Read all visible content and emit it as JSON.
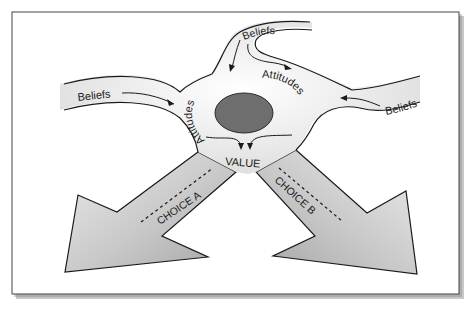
{
  "diagram": {
    "type": "flow diagram",
    "inputs": [
      {
        "id": "beliefs-left",
        "label": "Beliefs"
      },
      {
        "id": "beliefs-top",
        "label": "Beliefs"
      },
      {
        "id": "beliefs-right",
        "label": "Beliefs"
      }
    ],
    "intermediate": [
      {
        "id": "attitudes-left",
        "label": "Attitudes"
      },
      {
        "id": "attitudes-right",
        "label": "Attitudes"
      }
    ],
    "core": {
      "label": "VALUE",
      "center_fill": "#6e6e6e"
    },
    "outputs": [
      {
        "id": "choice-a",
        "label": "CHOICE A"
      },
      {
        "id": "choice-b",
        "label": "CHOICE B"
      }
    ],
    "colors": {
      "frame_border": "#444444",
      "shape_fill_light": "#f2f2f2",
      "arrow_fill_dark": "#a8a8a8",
      "stroke": "#1a1a1a"
    }
  }
}
